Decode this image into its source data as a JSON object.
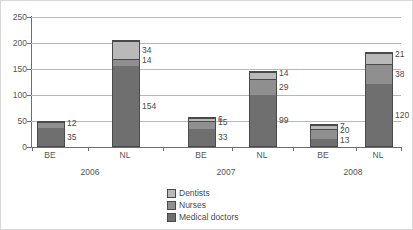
{
  "chart_data": {
    "type": "bar",
    "subtype": "stacked-bar",
    "title": "",
    "xlabel": "",
    "ylabel": "",
    "ylim": [
      0,
      250
    ],
    "yticks": [
      0,
      50,
      100,
      150,
      200,
      250
    ],
    "grid": true,
    "legend_position": "bottom-center",
    "categories": [
      "BE",
      "NL",
      "BE",
      "NL",
      "BE",
      "NL"
    ],
    "groups": [
      "2006",
      "2007",
      "2008"
    ],
    "series": [
      {
        "name": "Medical doctors",
        "color": "#6f6f6f",
        "values": [
          35,
          154,
          33,
          99,
          13,
          120
        ]
      },
      {
        "name": "Nurses",
        "color": "#8f8f8f",
        "values": [
          12,
          14,
          15,
          29,
          20,
          38
        ]
      },
      {
        "name": "Dentists",
        "color": "#b9b9b9",
        "values": [
          0,
          34,
          6,
          14,
          7,
          21
        ]
      }
    ]
  },
  "axis": {
    "y_ticks": [
      {
        "label": "250",
        "value": 250
      },
      {
        "label": "200",
        "value": 200
      },
      {
        "label": "150",
        "value": 150
      },
      {
        "label": "100",
        "value": 100
      },
      {
        "label": "50",
        "value": 50
      },
      {
        "label": "0",
        "value": 0
      }
    ]
  },
  "bars": [
    {
      "country": "BE",
      "group": "2006",
      "doctors": 35,
      "nurses": 12,
      "dentists": 0,
      "labels": {
        "doctors": "35",
        "nurses": "12",
        "dentists": ""
      }
    },
    {
      "country": "NL",
      "group": "2006",
      "doctors": 154,
      "nurses": 14,
      "dentists": 34,
      "labels": {
        "doctors": "154",
        "nurses": "14",
        "dentists": "34"
      }
    },
    {
      "country": "BE",
      "group": "2007",
      "doctors": 33,
      "nurses": 15,
      "dentists": 6,
      "labels": {
        "doctors": "33",
        "nurses": "15",
        "dentists": "6"
      }
    },
    {
      "country": "NL",
      "group": "2007",
      "doctors": 99,
      "nurses": 29,
      "dentists": 14,
      "labels": {
        "doctors": "99",
        "nurses": "29",
        "dentists": "14"
      }
    },
    {
      "country": "BE",
      "group": "2008",
      "doctors": 13,
      "nurses": 20,
      "dentists": 7,
      "labels": {
        "doctors": "13",
        "nurses": "20",
        "dentists": "7"
      }
    },
    {
      "country": "NL",
      "group": "2008",
      "doctors": 120,
      "nurses": 38,
      "dentists": 21,
      "labels": {
        "doctors": "120",
        "nurses": "38",
        "dentists": "21"
      }
    }
  ],
  "category_labels": [
    "BE",
    "NL",
    "BE",
    "NL",
    "BE",
    "NL"
  ],
  "group_labels": [
    "2006",
    "2007",
    "2008"
  ],
  "legend": {
    "items": [
      {
        "label": "Dentists",
        "color": "#b9b9b9"
      },
      {
        "label": "Nurses",
        "color": "#8f8f8f"
      },
      {
        "label": "Medical doctors",
        "color": "#6f6f6f"
      }
    ]
  }
}
